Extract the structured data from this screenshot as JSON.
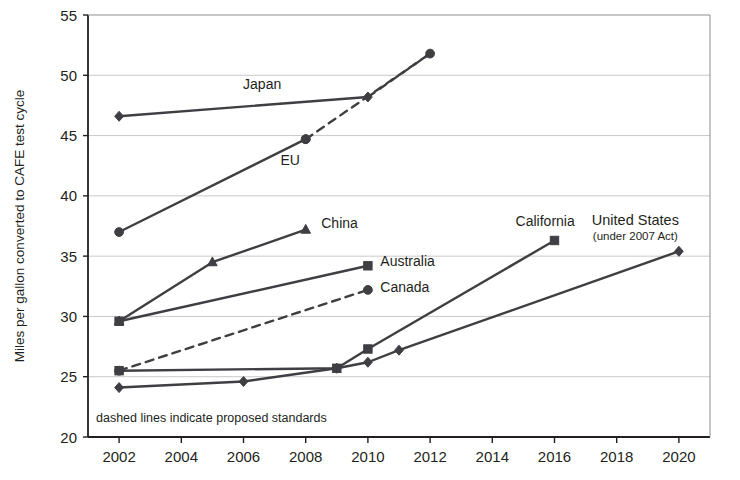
{
  "chart_data": {
    "type": "line",
    "title": "",
    "xlabel": "",
    "ylabel": "Miles per gallon converted to CAFE test cycle",
    "xlim": [
      2001,
      2021
    ],
    "ylim": [
      20,
      55
    ],
    "ytick_values": [
      20,
      25,
      30,
      35,
      40,
      45,
      50,
      55
    ],
    "ytick_labels": [
      "20",
      "25",
      "30",
      "35",
      "40",
      "45",
      "50",
      "55"
    ],
    "xtick_values": [
      2002,
      2004,
      2006,
      2008,
      2010,
      2012,
      2014,
      2016,
      2018,
      2020
    ],
    "xtick_labels": [
      "2002",
      "2004",
      "2006",
      "2008",
      "2010",
      "2012",
      "2014",
      "2016",
      "2018",
      "2020"
    ],
    "grid": "horizontal",
    "legend_position": "inline-labels",
    "annotation": "dashed lines indicate proposed standards",
    "line_color": "#3f3f43",
    "grid_color": "#c9c9c9",
    "axis_color": "#231f20",
    "series": [
      {
        "name": "Japan",
        "label": "Japan",
        "marker": "diamond",
        "style": "solid",
        "x": [
          2002,
          2010
        ],
        "values": [
          46.6,
          48.2
        ],
        "label_x": 2006.6,
        "label_y": 48.9
      },
      {
        "name": "Japan proposed",
        "label": "",
        "marker": "none",
        "style": "dashed",
        "x": [
          2010,
          2012
        ],
        "values": [
          48.2,
          51.8
        ],
        "label_x": null,
        "label_y": null
      },
      {
        "name": "EU",
        "label": "EU",
        "marker": "circle",
        "style": "solid",
        "x": [
          2002,
          2008
        ],
        "values": [
          37.0,
          44.7
        ],
        "label_x": 2007.5,
        "label_y": 42.6
      },
      {
        "name": "EU proposed",
        "label": "",
        "marker": "circle",
        "style": "dashed",
        "x": [
          2008,
          2012
        ],
        "values": [
          44.7,
          51.8
        ],
        "label_x": null,
        "label_y": null
      },
      {
        "name": "China",
        "label": "China",
        "marker": "triangle",
        "style": "solid",
        "x": [
          2002,
          2005,
          2008
        ],
        "values": [
          29.6,
          34.5,
          37.2
        ],
        "label_x": 2008.5,
        "label_y": 37.3
      },
      {
        "name": "Australia",
        "label": "Australia",
        "marker": "square",
        "style": "solid",
        "x": [
          2002,
          2010
        ],
        "values": [
          29.6,
          34.2
        ],
        "label_x": 2010.4,
        "label_y": 34.2
      },
      {
        "name": "Canada",
        "label": "Canada",
        "marker": "circle",
        "style": "dashed",
        "x": [
          2002,
          2010
        ],
        "values": [
          25.5,
          32.2
        ],
        "label_x": 2010.4,
        "label_y": 32.0
      },
      {
        "name": "California",
        "label": "California",
        "marker": "square",
        "style": "solid",
        "x": [
          2002,
          2009,
          2010,
          2016
        ],
        "values": [
          25.5,
          25.7,
          27.3,
          36.3
        ],
        "label_x": 2015.7,
        "label_y": 37.5
      },
      {
        "name": "United States",
        "label": "United States",
        "sublabel": "(under 2007 Act)",
        "marker": "diamond",
        "style": "solid",
        "x": [
          2002,
          2006,
          2009,
          2010,
          2011,
          2020
        ],
        "values": [
          24.1,
          24.6,
          25.7,
          26.2,
          27.2,
          35.4
        ],
        "label_x": 2018.6,
        "label_y": 37.6
      }
    ]
  }
}
